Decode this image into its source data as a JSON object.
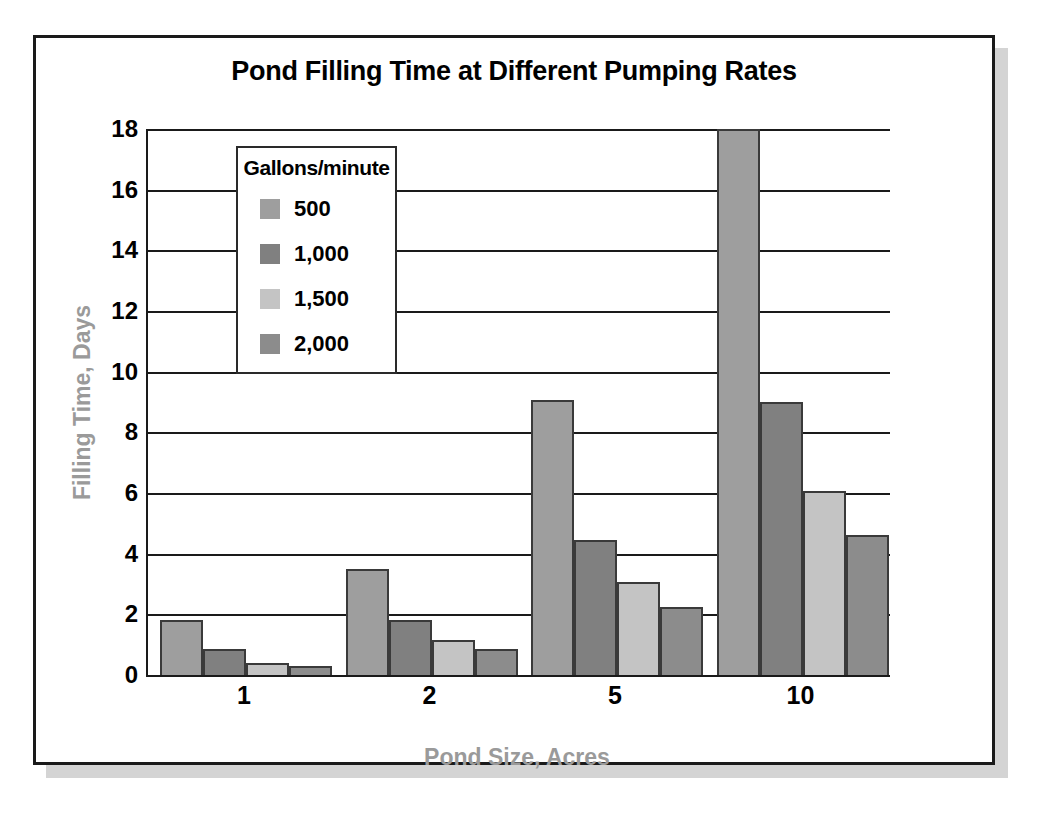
{
  "figure": {
    "title": "Pond Filling Time at Different Pumping Rates"
  },
  "legend": {
    "title": "Gallons/minute",
    "entries": [
      {
        "label": "500",
        "color": "#9e9e9e"
      },
      {
        "label": "1,000",
        "color": "#808080"
      },
      {
        "label": "1,500",
        "color": "#c4c4c4"
      },
      {
        "label": "2,000",
        "color": "#8c8c8c"
      }
    ]
  },
  "axes": {
    "y_ticks": [
      "0",
      "2",
      "4",
      "6",
      "8",
      "10",
      "12",
      "14",
      "16",
      "18"
    ],
    "x_ticks": [
      "1",
      "2",
      "5",
      "10"
    ],
    "ylabel": "Filling Time, Days",
    "xlabel": "Pond Size, Acres"
  },
  "chart_data": {
    "type": "bar",
    "title": "Pond Filling Time at Different Pumping Rates",
    "xlabel": "Pond Size, Acres",
    "ylabel": "Filling Time, Days",
    "categories": [
      "1",
      "2",
      "5",
      "10"
    ],
    "ylim": [
      0,
      18
    ],
    "ytick_step": 2,
    "grid": true,
    "legend_title": "Gallons/minute",
    "legend_position": "inside-upper-left",
    "series": [
      {
        "name": "500",
        "color": "#9e9e9e",
        "values": [
          1.8,
          3.5,
          9.05,
          18.0
        ]
      },
      {
        "name": "1,000",
        "color": "#808080",
        "values": [
          0.85,
          1.8,
          4.45,
          9.0
        ]
      },
      {
        "name": "1,500",
        "color": "#c4c4c4",
        "values": [
          0.4,
          1.15,
          3.05,
          6.05
        ]
      },
      {
        "name": "2,000",
        "color": "#8c8c8c",
        "values": [
          0.3,
          0.85,
          2.25,
          4.6
        ]
      }
    ]
  }
}
